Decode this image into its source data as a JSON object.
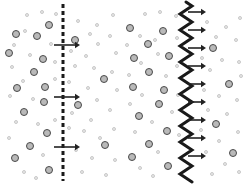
{
  "figure": {
    "type": "diagram",
    "title": "",
    "background_color": "#ffffff",
    "width": 245,
    "height": 185
  },
  "colors": {
    "particle_dark_stroke": "#4a4a4a",
    "particle_dark_fill": "#b9b9b9",
    "particle_light_stroke": "#c9c9c9",
    "particle_light_fill": "#e8e8e8",
    "membrane_dark": "#1a1a1a",
    "arrow": "#222222",
    "background": "#ffffff"
  },
  "panels": [
    {
      "id": "panel-left",
      "name": "dashed-membrane-panel",
      "membrane": {
        "name": "dashed-membrane",
        "style": "dashed",
        "x": 63,
        "top": 4,
        "bottom": 181,
        "thickness": 3,
        "dash_length": 4,
        "gap_length": 3,
        "color": "#1a1a1a"
      },
      "arrows": [
        {
          "y": 45,
          "x_start": 54,
          "x_end": 80,
          "direction": "right"
        },
        {
          "y": 97,
          "x_start": 54,
          "x_end": 80,
          "direction": "right"
        },
        {
          "y": 147,
          "x_start": 54,
          "x_end": 80,
          "direction": "right"
        }
      ],
      "arrow_count": 3,
      "particles_dark_left": 14,
      "particles_dark_right": 4,
      "particles_light_left": 18,
      "particles_light_right": 26
    },
    {
      "id": "panel-right",
      "name": "wavy-membrane-panel",
      "membrane": {
        "name": "wavy-membrane",
        "style": "wavy",
        "x": 64,
        "top": 2,
        "bottom": 183,
        "thickness": 3,
        "amplitude": 6,
        "wavelength": 16,
        "color": "#1a1a1a"
      },
      "arrows": [
        {
          "y": 12,
          "x_start": 66,
          "x_end": 84,
          "direction": "right"
        },
        {
          "y": 30,
          "x_start": 66,
          "x_end": 84,
          "direction": "right"
        },
        {
          "y": 48,
          "x_start": 66,
          "x_end": 84,
          "direction": "right"
        },
        {
          "y": 66,
          "x_start": 66,
          "x_end": 84,
          "direction": "right"
        },
        {
          "y": 84,
          "x_start": 66,
          "x_end": 84,
          "direction": "right"
        },
        {
          "y": 102,
          "x_start": 66,
          "x_end": 84,
          "direction": "right"
        },
        {
          "y": 120,
          "x_start": 66,
          "x_end": 84,
          "direction": "right"
        },
        {
          "y": 138,
          "x_start": 66,
          "x_end": 84,
          "direction": "right"
        },
        {
          "y": 156,
          "x_start": 66,
          "x_end": 84,
          "direction": "right"
        }
      ],
      "arrow_count": 9,
      "particles_dark_left": 14,
      "particles_dark_right": 4,
      "particles_light_left": 20,
      "particles_light_right": 24
    }
  ],
  "particles": {
    "panel_left": [
      {
        "x": 16,
        "y": 34,
        "r": 4.0,
        "type": "dark"
      },
      {
        "x": 49,
        "y": 25,
        "r": 4.0,
        "type": "dark"
      },
      {
        "x": 37,
        "y": 36,
        "r": 4.2,
        "type": "dark"
      },
      {
        "x": 9,
        "y": 53,
        "r": 4.2,
        "type": "dark"
      },
      {
        "x": 43,
        "y": 59,
        "r": 4.0,
        "type": "dark"
      },
      {
        "x": 34,
        "y": 72,
        "r": 4.2,
        "type": "dark"
      },
      {
        "x": 17,
        "y": 88,
        "r": 4.2,
        "type": "dark"
      },
      {
        "x": 45,
        "y": 87,
        "r": 4.0,
        "type": "dark"
      },
      {
        "x": 44,
        "y": 102,
        "r": 4.2,
        "type": "dark"
      },
      {
        "x": 24,
        "y": 112,
        "r": 4.2,
        "type": "dark"
      },
      {
        "x": 47,
        "y": 133,
        "r": 4.0,
        "type": "dark"
      },
      {
        "x": 30,
        "y": 146,
        "r": 4.2,
        "type": "dark"
      },
      {
        "x": 15,
        "y": 158,
        "r": 4.2,
        "type": "dark"
      },
      {
        "x": 49,
        "y": 170,
        "r": 4.2,
        "type": "dark"
      },
      {
        "x": 27,
        "y": 15,
        "r": 2.4,
        "type": "light"
      },
      {
        "x": 42,
        "y": 12,
        "r": 2.0,
        "type": "light"
      },
      {
        "x": 56,
        "y": 14,
        "r": 2.4,
        "type": "light"
      },
      {
        "x": 25,
        "y": 31,
        "r": 2.4,
        "type": "light"
      },
      {
        "x": 14,
        "y": 45,
        "r": 2.4,
        "type": "light"
      },
      {
        "x": 51,
        "y": 44,
        "r": 2.4,
        "type": "light"
      },
      {
        "x": 30,
        "y": 55,
        "r": 2.4,
        "type": "light"
      },
      {
        "x": 55,
        "y": 62,
        "r": 2.2,
        "type": "light"
      },
      {
        "x": 12,
        "y": 67,
        "r": 2.4,
        "type": "light"
      },
      {
        "x": 23,
        "y": 81,
        "r": 2.2,
        "type": "light"
      },
      {
        "x": 55,
        "y": 79,
        "r": 2.4,
        "type": "light"
      },
      {
        "x": 10,
        "y": 96,
        "r": 2.4,
        "type": "light"
      },
      {
        "x": 33,
        "y": 99,
        "r": 2.2,
        "type": "light"
      },
      {
        "x": 16,
        "y": 122,
        "r": 2.4,
        "type": "light"
      },
      {
        "x": 38,
        "y": 124,
        "r": 2.4,
        "type": "light"
      },
      {
        "x": 55,
        "y": 120,
        "r": 2.2,
        "type": "light"
      },
      {
        "x": 9,
        "y": 138,
        "r": 2.4,
        "type": "light"
      },
      {
        "x": 43,
        "y": 155,
        "r": 2.4,
        "type": "light"
      },
      {
        "x": 24,
        "y": 172,
        "r": 2.4,
        "type": "light"
      },
      {
        "x": 36,
        "y": 178,
        "r": 2.2,
        "type": "light"
      },
      {
        "x": 75,
        "y": 40,
        "r": 4.2,
        "type": "dark"
      },
      {
        "x": 104,
        "y": 79,
        "r": 4.2,
        "type": "dark"
      },
      {
        "x": 78,
        "y": 105,
        "r": 4.2,
        "type": "dark"
      },
      {
        "x": 105,
        "y": 145,
        "r": 4.2,
        "type": "dark"
      },
      {
        "x": 78,
        "y": 21,
        "r": 2.4,
        "type": "light"
      },
      {
        "x": 97,
        "y": 25,
        "r": 2.2,
        "type": "light"
      },
      {
        "x": 113,
        "y": 15,
        "r": 2.2,
        "type": "light"
      },
      {
        "x": 90,
        "y": 34,
        "r": 2.4,
        "type": "light"
      },
      {
        "x": 110,
        "y": 36,
        "r": 2.4,
        "type": "light"
      },
      {
        "x": 98,
        "y": 44,
        "r": 2.4,
        "type": "light"
      },
      {
        "x": 71,
        "y": 51,
        "r": 2.4,
        "type": "light"
      },
      {
        "x": 86,
        "y": 56,
        "r": 2.2,
        "type": "light"
      },
      {
        "x": 116,
        "y": 53,
        "r": 2.2,
        "type": "light"
      },
      {
        "x": 75,
        "y": 66,
        "r": 2.4,
        "type": "light"
      },
      {
        "x": 94,
        "y": 68,
        "r": 2.4,
        "type": "light"
      },
      {
        "x": 112,
        "y": 72,
        "r": 2.2,
        "type": "light"
      },
      {
        "x": 69,
        "y": 82,
        "r": 2.4,
        "type": "light"
      },
      {
        "x": 88,
        "y": 88,
        "r": 2.4,
        "type": "light"
      },
      {
        "x": 117,
        "y": 90,
        "r": 2.2,
        "type": "light"
      },
      {
        "x": 97,
        "y": 100,
        "r": 2.4,
        "type": "light"
      },
      {
        "x": 72,
        "y": 113,
        "r": 2.2,
        "type": "light"
      },
      {
        "x": 110,
        "y": 110,
        "r": 2.4,
        "type": "light"
      },
      {
        "x": 91,
        "y": 120,
        "r": 2.4,
        "type": "light"
      },
      {
        "x": 69,
        "y": 128,
        "r": 2.4,
        "type": "light"
      },
      {
        "x": 84,
        "y": 131,
        "r": 2.2,
        "type": "light"
      },
      {
        "x": 114,
        "y": 129,
        "r": 2.4,
        "type": "light"
      },
      {
        "x": 100,
        "y": 138,
        "r": 2.2,
        "type": "light"
      },
      {
        "x": 76,
        "y": 150,
        "r": 2.4,
        "type": "light"
      },
      {
        "x": 92,
        "y": 158,
        "r": 2.4,
        "type": "light"
      },
      {
        "x": 115,
        "y": 160,
        "r": 2.2,
        "type": "light"
      },
      {
        "x": 82,
        "y": 172,
        "r": 2.4,
        "type": "light"
      },
      {
        "x": 106,
        "y": 175,
        "r": 2.4,
        "type": "light"
      }
    ],
    "panel_right": [
      {
        "x": 8,
        "y": 28,
        "r": 4.2,
        "type": "dark"
      },
      {
        "x": 41,
        "y": 31,
        "r": 4.2,
        "type": "dark"
      },
      {
        "x": 26,
        "y": 44,
        "r": 4.2,
        "type": "dark"
      },
      {
        "x": 12,
        "y": 58,
        "r": 4.2,
        "type": "dark"
      },
      {
        "x": 47,
        "y": 56,
        "r": 4.2,
        "type": "dark"
      },
      {
        "x": 27,
        "y": 72,
        "r": 4.2,
        "type": "dark"
      },
      {
        "x": 11,
        "y": 87,
        "r": 4.2,
        "type": "dark"
      },
      {
        "x": 42,
        "y": 90,
        "r": 4.2,
        "type": "dark"
      },
      {
        "x": 37,
        "y": 104,
        "r": 4.2,
        "type": "dark"
      },
      {
        "x": 17,
        "y": 116,
        "r": 4.2,
        "type": "dark"
      },
      {
        "x": 45,
        "y": 131,
        "r": 4.2,
        "type": "dark"
      },
      {
        "x": 27,
        "y": 144,
        "r": 4.2,
        "type": "dark"
      },
      {
        "x": 10,
        "y": 157,
        "r": 4.2,
        "type": "dark"
      },
      {
        "x": 46,
        "y": 166,
        "r": 4.2,
        "type": "dark"
      },
      {
        "x": 23,
        "y": 14,
        "r": 2.2,
        "type": "light"
      },
      {
        "x": 38,
        "y": 12,
        "r": 2.2,
        "type": "light"
      },
      {
        "x": 54,
        "y": 16,
        "r": 2.4,
        "type": "light"
      },
      {
        "x": 18,
        "y": 36,
        "r": 2.4,
        "type": "light"
      },
      {
        "x": 33,
        "y": 40,
        "r": 2.2,
        "type": "light"
      },
      {
        "x": 55,
        "y": 38,
        "r": 2.4,
        "type": "light"
      },
      {
        "x": 5,
        "y": 45,
        "r": 2.2,
        "type": "light"
      },
      {
        "x": 36,
        "y": 54,
        "r": 2.4,
        "type": "light"
      },
      {
        "x": 19,
        "y": 63,
        "r": 2.4,
        "type": "light"
      },
      {
        "x": 55,
        "y": 66,
        "r": 2.2,
        "type": "light"
      },
      {
        "x": 7,
        "y": 75,
        "r": 2.4,
        "type": "light"
      },
      {
        "x": 44,
        "y": 76,
        "r": 2.2,
        "type": "light"
      },
      {
        "x": 20,
        "y": 95,
        "r": 2.4,
        "type": "light"
      },
      {
        "x": 56,
        "y": 95,
        "r": 2.2,
        "type": "light"
      },
      {
        "x": 8,
        "y": 104,
        "r": 2.4,
        "type": "light"
      },
      {
        "x": 50,
        "y": 112,
        "r": 2.4,
        "type": "light"
      },
      {
        "x": 30,
        "y": 122,
        "r": 2.2,
        "type": "light"
      },
      {
        "x": 13,
        "y": 132,
        "r": 2.4,
        "type": "light"
      },
      {
        "x": 57,
        "y": 135,
        "r": 2.2,
        "type": "light"
      },
      {
        "x": 36,
        "y": 152,
        "r": 2.4,
        "type": "light"
      },
      {
        "x": 18,
        "y": 168,
        "r": 2.4,
        "type": "light"
      },
      {
        "x": 31,
        "y": 176,
        "r": 2.2,
        "type": "light"
      },
      {
        "x": 91,
        "y": 48,
        "r": 4.2,
        "type": "dark"
      },
      {
        "x": 107,
        "y": 84,
        "r": 4.2,
        "type": "dark"
      },
      {
        "x": 94,
        "y": 124,
        "r": 4.2,
        "type": "dark"
      },
      {
        "x": 111,
        "y": 153,
        "r": 4.2,
        "type": "dark"
      },
      {
        "x": 85,
        "y": 22,
        "r": 2.4,
        "type": "light"
      },
      {
        "x": 104,
        "y": 27,
        "r": 2.2,
        "type": "light"
      },
      {
        "x": 118,
        "y": 18,
        "r": 2.2,
        "type": "light"
      },
      {
        "x": 94,
        "y": 37,
        "r": 2.4,
        "type": "light"
      },
      {
        "x": 114,
        "y": 40,
        "r": 2.4,
        "type": "light"
      },
      {
        "x": 80,
        "y": 58,
        "r": 2.4,
        "type": "light"
      },
      {
        "x": 100,
        "y": 60,
        "r": 2.2,
        "type": "light"
      },
      {
        "x": 117,
        "y": 62,
        "r": 2.2,
        "type": "light"
      },
      {
        "x": 88,
        "y": 70,
        "r": 2.4,
        "type": "light"
      },
      {
        "x": 119,
        "y": 76,
        "r": 2.2,
        "type": "light"
      },
      {
        "x": 82,
        "y": 90,
        "r": 2.4,
        "type": "light"
      },
      {
        "x": 97,
        "y": 96,
        "r": 2.2,
        "type": "light"
      },
      {
        "x": 115,
        "y": 100,
        "r": 2.4,
        "type": "light"
      },
      {
        "x": 86,
        "y": 110,
        "r": 2.4,
        "type": "light"
      },
      {
        "x": 105,
        "y": 114,
        "r": 2.2,
        "type": "light"
      },
      {
        "x": 79,
        "y": 130,
        "r": 2.4,
        "type": "light"
      },
      {
        "x": 116,
        "y": 132,
        "r": 2.2,
        "type": "light"
      },
      {
        "x": 97,
        "y": 141,
        "r": 2.4,
        "type": "light"
      },
      {
        "x": 84,
        "y": 152,
        "r": 2.2,
        "type": "light"
      },
      {
        "x": 103,
        "y": 164,
        "r": 2.4,
        "type": "light"
      },
      {
        "x": 90,
        "y": 174,
        "r": 2.4,
        "type": "light"
      },
      {
        "x": 117,
        "y": 172,
        "r": 2.2,
        "type": "light"
      }
    ]
  }
}
